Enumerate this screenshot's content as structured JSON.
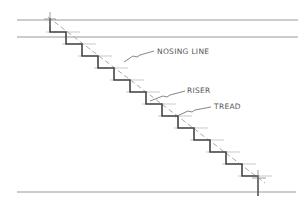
{
  "diagram": {
    "type": "stair-section",
    "labels": {
      "nosing_line": "NOSING  LINE",
      "riser": "RISER",
      "tread": "TREAD"
    },
    "steps": 13,
    "colors": {
      "stair": "#444444",
      "guide": "#999999",
      "nosing": "#aaaaaa",
      "text": "#555555"
    }
  }
}
